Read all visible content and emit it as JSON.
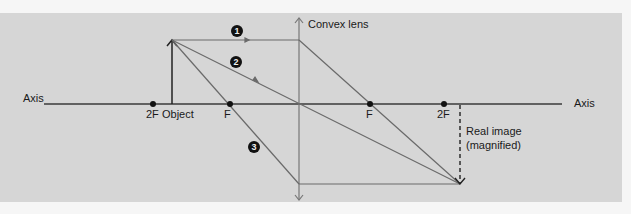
{
  "diagram": {
    "lens_label": "Convex lens",
    "axis_label_left": "Axis",
    "axis_label_right": "Axis",
    "points": {
      "left_2f": "2F",
      "object": "Object",
      "left_f": "F",
      "right_f": "F",
      "right_2f": "2F"
    },
    "rays": [
      {
        "id": 1,
        "marker": "1",
        "description": "Parallel to axis, refracts through far focal point"
      },
      {
        "id": 2,
        "marker": "2",
        "description": "Through optical centre, undeviated"
      },
      {
        "id": 3,
        "marker": "3",
        "description": "Through near focal point, emerges parallel"
      }
    ],
    "image_label_line1": "Real image",
    "image_label_line2": "(magnified)",
    "colors": {
      "panel": "#d6d6d6",
      "ray": "#6a6a6a",
      "axis": "#3a3a3a",
      "text": "#1a1a1a"
    }
  }
}
